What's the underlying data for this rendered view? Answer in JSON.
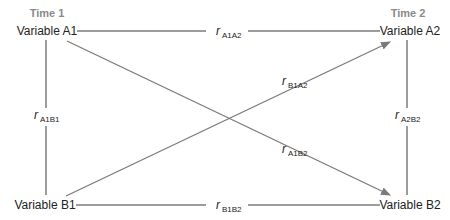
{
  "diagram": {
    "type": "cross-lagged panel",
    "time_labels": {
      "t1": "Time 1",
      "t2": "Time 2"
    },
    "nodes": {
      "a1": "Variable A1",
      "a2": "Variable A2",
      "b1": "Variable B1",
      "b2": "Variable B2"
    },
    "paths": {
      "a1a2": {
        "r": "r",
        "sub": "A1A2"
      },
      "b1b2": {
        "r": "r",
        "sub": "B1B2"
      },
      "a1b1": {
        "r": "r",
        "sub": "A1B1"
      },
      "a2b2": {
        "r": "r",
        "sub": "A2B2"
      },
      "b1a2": {
        "r": "r",
        "sub": "B1A2"
      },
      "a1b2": {
        "r": "r",
        "sub": "A1B2"
      }
    },
    "colors": {
      "line": "#3a3a3a",
      "arrow": "#7a7a7a",
      "time_label": "#8a8a8a"
    }
  }
}
